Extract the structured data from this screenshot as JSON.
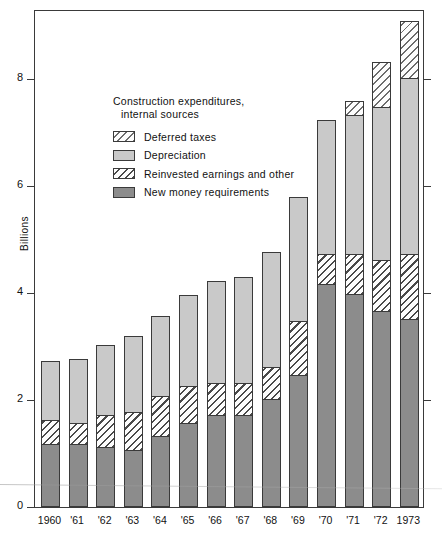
{
  "chart_data": {
    "type": "bar",
    "subtype": "stacked-bar",
    "title": "",
    "xlabel": "",
    "ylabel": "Billions",
    "ylim": [
      0,
      9.3
    ],
    "yticks": [
      0,
      2,
      4,
      6,
      8
    ],
    "ytick_labels": [
      "0",
      "2",
      "4",
      "6",
      "8"
    ],
    "grid": false,
    "legend_position": "upper-left-inside",
    "legend_title_line1": "Construction expenditures,",
    "legend_title_line2": "internal sources",
    "categories": [
      "1960",
      "'61",
      "'62",
      "'63",
      "'64",
      "'65",
      "'66",
      "'67",
      "'68",
      "'69",
      "'70",
      "'71",
      "'72",
      "1973"
    ],
    "series": [
      {
        "name": "New money requirements",
        "style": "solid-dark-gray",
        "color": "#8c8c8c",
        "values": [
          1.15,
          1.15,
          1.1,
          1.05,
          1.3,
          1.55,
          1.7,
          1.7,
          2.0,
          2.45,
          4.15,
          3.95,
          3.65,
          3.5
        ]
      },
      {
        "name": "Reinvested earnings and other",
        "style": "hatched",
        "color": "#ffffff",
        "values": [
          0.45,
          0.4,
          0.6,
          0.7,
          0.75,
          0.7,
          0.6,
          0.6,
          0.6,
          1.0,
          0.55,
          0.75,
          0.95,
          1.2
        ]
      },
      {
        "name": "Depreciation",
        "style": "solid-light-gray",
        "color": "#c9c9c9",
        "values": [
          1.1,
          1.2,
          1.3,
          1.43,
          1.5,
          1.7,
          1.9,
          1.98,
          2.15,
          2.33,
          2.5,
          2.6,
          2.85,
          3.3
        ]
      },
      {
        "name": "Deferred taxes",
        "style": "light-hatched",
        "color": "#ffffff",
        "values": [
          0.0,
          0.0,
          0.0,
          0.0,
          0.0,
          0.0,
          0.0,
          0.0,
          0.0,
          0.0,
          0.0,
          0.27,
          0.85,
          1.05
        ]
      }
    ],
    "totals": [
      2.7,
      2.75,
      3.0,
      3.18,
      3.55,
      3.95,
      4.2,
      4.28,
      4.75,
      5.78,
      7.2,
      7.57,
      8.3,
      9.05
    ]
  },
  "legend": {
    "items": [
      {
        "label": "Deferred taxes",
        "swatch": "deferred-taxes-swatch"
      },
      {
        "label": "Depreciation",
        "swatch": "depreciation-swatch"
      },
      {
        "label": "Reinvested earnings and other",
        "swatch": "reinvested-earnings-swatch"
      },
      {
        "label": "New money requirements",
        "swatch": "new-money-swatch"
      }
    ]
  },
  "colors": {
    "new_money": "#8c8c8c",
    "depreciation": "#c9c9c9",
    "hatch_ink": "#4a4a4a",
    "frame": "#3a3a3a"
  }
}
